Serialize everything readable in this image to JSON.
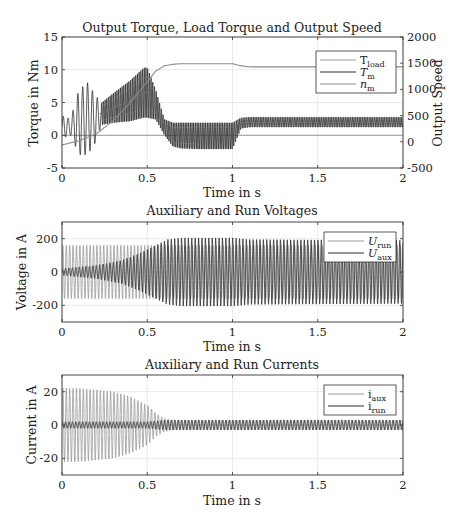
{
  "figure": {
    "background": "#ffffff",
    "axis_color": "#333333",
    "grid_color": "#e4e4e4",
    "series_colors": {
      "light": "#9a9a9a",
      "dark": "#2e2e2e",
      "speed": "#8c8c8c"
    }
  },
  "chart_data": [
    {
      "type": "line",
      "title": "Output Torque, Load Torque and Output Speed",
      "xlabel": "Time in s",
      "ylabel": "Torque in Nm",
      "ylabel_right": "Output Speed",
      "xlim": [
        0,
        2
      ],
      "ylim": [
        -5,
        15
      ],
      "ylim_right": [
        -500,
        2000
      ],
      "xticks": [
        "0",
        "0.5",
        "1",
        "1.5",
        "2"
      ],
      "yticks": [
        "-5",
        "0",
        "5",
        "10",
        "15"
      ],
      "yticks_right": [
        "-500",
        "0",
        "500",
        "1000",
        "1500",
        "2000"
      ],
      "grid": true,
      "legend_position": "northeast",
      "legend": [
        {
          "name": "T",
          "sub": "load",
          "italic": false,
          "color": "light"
        },
        {
          "name": "T",
          "sub": "m",
          "italic": true,
          "color": "dark"
        },
        {
          "name": "n",
          "sub": "m",
          "italic": true,
          "color": "speed"
        }
      ],
      "series": [
        {
          "name": "T_load",
          "axis": "left",
          "description": "constant load torque",
          "x": [
            0,
            0.999,
            1.0,
            2.0
          ],
          "y": [
            0,
            0,
            0,
            0
          ]
        },
        {
          "name": "T_m",
          "axis": "left",
          "description": "oscillating motor torque envelope (50 Hz ripple)",
          "envelope_t": [
            0,
            0.05,
            0.1,
            0.15,
            0.2,
            0.23,
            0.3,
            0.4,
            0.48,
            0.5,
            0.55,
            0.6,
            0.65,
            0.7,
            0.8,
            0.9,
            0.99,
            1.0,
            1.05,
            1.1,
            1.5,
            2.0
          ],
          "envelope_upper": [
            3,
            2.5,
            7,
            8,
            6,
            5,
            6.5,
            8.5,
            10.5,
            10.5,
            7,
            2.5,
            2,
            2,
            2,
            2,
            2,
            2,
            2.7,
            2.8,
            2.8,
            2.8
          ],
          "envelope_lower": [
            -0.5,
            0,
            -3,
            -3,
            -1,
            1.5,
            1.8,
            2,
            2.5,
            2.5,
            2.3,
            0,
            -1.8,
            -2.1,
            -2.2,
            -2.2,
            -2.2,
            -2.2,
            1,
            1.2,
            1.2,
            1.2
          ]
        },
        {
          "name": "n_m",
          "axis": "right",
          "x": [
            0,
            0.1,
            0.2,
            0.3,
            0.4,
            0.5,
            0.55,
            0.6,
            0.65,
            0.7,
            0.8,
            0.99,
            1.0,
            1.05,
            1.1,
            1.5,
            2.0
          ],
          "y": [
            -60,
            20,
            150,
            400,
            750,
            1150,
            1350,
            1450,
            1480,
            1490,
            1490,
            1490,
            1490,
            1450,
            1430,
            1430,
            1430
          ]
        }
      ]
    },
    {
      "type": "line",
      "title": "Auxiliary and Run Voltages",
      "xlabel": "Time in s",
      "ylabel": "Voltage in A",
      "xlim": [
        0,
        2
      ],
      "ylim": [
        -300,
        300
      ],
      "xticks": [
        "0",
        "0.5",
        "1",
        "1.5",
        "2"
      ],
      "yticks": [
        "-200",
        "0",
        "200"
      ],
      "grid": true,
      "legend_position": "northeast",
      "legend": [
        {
          "name": "U",
          "sub": "run",
          "italic": true,
          "color": "light"
        },
        {
          "name": "U",
          "sub": "aux",
          "italic": true,
          "color": "dark"
        }
      ],
      "series": [
        {
          "name": "U_run",
          "frequency_hz": 50,
          "envelope_t": [
            0,
            0.5,
            1.0,
            2.0
          ],
          "amplitude": [
            160,
            160,
            160,
            160
          ]
        },
        {
          "name": "U_aux",
          "frequency_hz": 50,
          "envelope_t": [
            0,
            0.2,
            0.35,
            0.45,
            0.55,
            0.62,
            0.7,
            1.0,
            1.1,
            2.0
          ],
          "amplitude": [
            20,
            40,
            70,
            110,
            160,
            195,
            205,
            205,
            195,
            190
          ]
        }
      ]
    },
    {
      "type": "line",
      "title": "Auxiliary and Run Currents",
      "xlabel": "Time in s",
      "ylabel": "Current in A",
      "xlim": [
        0,
        2
      ],
      "ylim": [
        -30,
        30
      ],
      "xticks": [
        "0",
        "0.5",
        "1",
        "1.5",
        "2"
      ],
      "yticks": [
        "-20",
        "0",
        "20"
      ],
      "grid": true,
      "legend_position": "northeast",
      "legend": [
        {
          "name": "i",
          "sub": "aux",
          "italic": false,
          "color": "light"
        },
        {
          "name": "i",
          "sub": "run",
          "italic": false,
          "color": "dark"
        }
      ],
      "series": [
        {
          "name": "i_aux",
          "frequency_hz": 50,
          "envelope_t": [
            0,
            0.1,
            0.3,
            0.4,
            0.5,
            0.55,
            0.6,
            0.65,
            2.0
          ],
          "amplitude": [
            22,
            22,
            20,
            17,
            12,
            7,
            4,
            3,
            3
          ]
        },
        {
          "name": "i_run",
          "frequency_hz": 50,
          "envelope_t": [
            0,
            0.5,
            0.6,
            2.0
          ],
          "amplitude": [
            2,
            2,
            3,
            3
          ]
        }
      ]
    }
  ],
  "layout": {
    "axes_x": [
      62,
      403
    ],
    "panels": [
      {
        "top": 37,
        "bottom": 168
      },
      {
        "top": 222,
        "bottom": 322
      },
      {
        "top": 375,
        "bottom": 475
      }
    ]
  }
}
